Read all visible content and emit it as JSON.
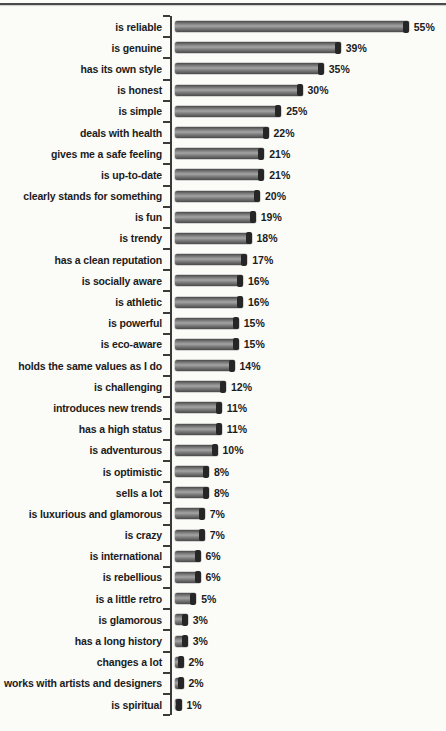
{
  "page": {
    "kind": "scanned report page with horizontal bar chart",
    "background_color": "#fbfbf8",
    "top_rule_color": "#4a4a4a"
  },
  "chart_data": {
    "type": "bar",
    "orientation": "horizontal",
    "title": "",
    "xlabel": "",
    "ylabel": "",
    "unit": "%",
    "xlim": [
      0,
      60
    ],
    "grid": false,
    "legend": false,
    "axis_color": "#3a3a3a",
    "text_color": "#1c1c1c",
    "bar_color": "#7f7f7f",
    "bar_highlight": "#a4a4a4",
    "bar_shadow": "#4a4a4a",
    "bar_cap_color": "#262626",
    "categories": [
      "is reliable",
      "is genuine",
      "has its own style",
      "is honest",
      "is simple",
      "deals with health",
      "gives me a safe feeling",
      "is up-to-date",
      "clearly stands for something",
      "is fun",
      "is trendy",
      "has a clean reputation",
      "is socially aware",
      "is athletic",
      "is powerful",
      "is eco-aware",
      "holds the same values as I do",
      "is challenging",
      "introduces new trends",
      "has a high status",
      "is adventurous",
      "is optimistic",
      "sells a lot",
      "is luxurious and glamorous",
      "is crazy",
      "is international",
      "is rebellious",
      "is a little retro",
      "is glamorous",
      "has a long history",
      "changes a lot",
      "works with artists and designers",
      "is spiritual"
    ],
    "values": [
      55,
      39,
      35,
      30,
      25,
      22,
      21,
      21,
      20,
      19,
      18,
      17,
      16,
      16,
      15,
      15,
      14,
      12,
      11,
      11,
      10,
      8,
      8,
      7,
      7,
      6,
      6,
      5,
      3,
      3,
      2,
      2,
      1
    ],
    "value_labels": [
      "55%",
      "39%",
      "35%",
      "30%",
      "25%",
      "22%",
      "21%",
      "21%",
      "20%",
      "19%",
      "18%",
      "17%",
      "16%",
      "16%",
      "15%",
      "15%",
      "14%",
      "12%",
      "11%",
      "11%",
      "10%",
      "8%",
      "8%",
      "7%",
      "7%",
      "6%",
      "6%",
      "5%",
      "3%",
      "3%",
      "2%",
      "2%",
      "1%"
    ]
  }
}
